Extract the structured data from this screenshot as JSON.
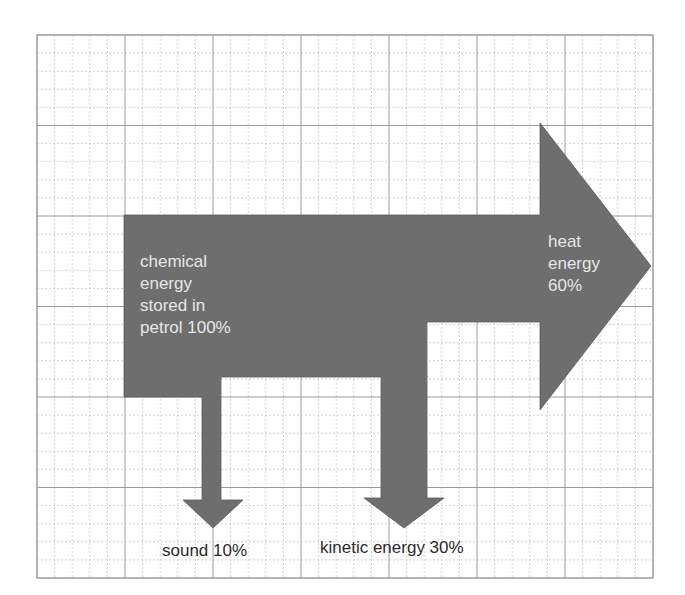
{
  "diagram": {
    "type": "sankey-energy-transfer",
    "colors": {
      "arrow_fill": "#6e6e6e",
      "grid_major": "#9a9a9a",
      "grid_minor": "#cfcfcf",
      "label_on_arrow": "#e6e6e6",
      "label_outside": "#2b2b2b"
    },
    "input": {
      "label": "chemical\nenergy\nstored in\npetrol 100%",
      "percent": 100
    },
    "outputs": [
      {
        "id": "heat",
        "label": "heat\nenergy\n60%",
        "percent": 60
      },
      {
        "id": "sound",
        "label": "sound 10%",
        "percent": 10
      },
      {
        "id": "kinetic",
        "label": "kinetic energy 30%",
        "percent": 30
      }
    ]
  }
}
